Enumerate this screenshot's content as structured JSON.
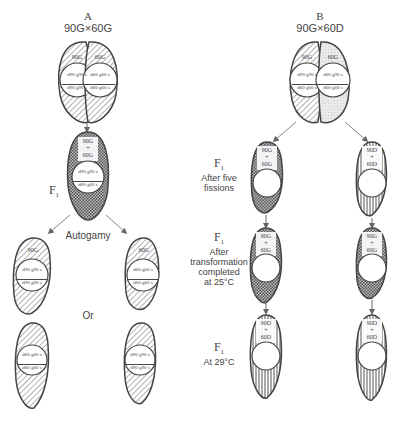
{
  "panels": {
    "a": {
      "letter": "A",
      "cross": "90G×60G",
      "parent_left": {
        "serotype": "90G",
        "genotype_top": "d90 g90 s",
        "genotype_bottom": "d90 g90 s"
      },
      "parent_right": {
        "serotype": "60G",
        "genotype_top": "d60 g60 s",
        "genotype_bottom": "d60 g60 s"
      },
      "f1": {
        "label": "F",
        "sub": "1",
        "serotype_top": "90G",
        "plus": "+",
        "serotype_bottom": "60G",
        "genotype_top": "d90 g90 s",
        "genotype_bottom": "d60 g60 s"
      },
      "process": "Autogamy",
      "or": "Or",
      "exconjugant_left": {
        "serotype": "90G",
        "genotype_top": "d90 g90 s",
        "genotype_bottom": "d90 g90 s"
      },
      "exconjugant_right": {
        "serotype": "60G",
        "genotype_top": "d60 g60 s",
        "genotype_bottom": "d60 g60 s"
      },
      "bottom_left": {
        "genotype_top": "d60 g60 s",
        "genotype_bottom": "d60 g60 s"
      },
      "bottom_right": {
        "genotype_top": "d90 g90 s",
        "genotype_bottom": "d90 g90 s"
      }
    },
    "b": {
      "letter": "B",
      "cross": "90G×60D",
      "parent_left": {
        "serotype": "90G",
        "genotype_top": "d90 g90 s",
        "genotype_bottom": "d60 g60 s"
      },
      "parent_right": {
        "serotype": "60G",
        "genotype_top": "d60 g90 s",
        "genotype_bottom": "d60 g60 s"
      },
      "rows": [
        {
          "label": "F",
          "sub": "1",
          "text": [
            "After five",
            "fissions"
          ],
          "left": {
            "top": "90G",
            "plus": "+",
            "bottom": "60G"
          },
          "right": {
            "top": "90D",
            "plus": "+",
            "bottom": "60D"
          }
        },
        {
          "label": "F",
          "sub": "1",
          "text": [
            "After",
            "transformation",
            "completed",
            "at 25°C"
          ],
          "left": {
            "top": "90G",
            "plus": "+",
            "bottom": "60G"
          },
          "right": {
            "top": "90G",
            "plus": "+",
            "bottom": "60G"
          }
        },
        {
          "label": "F",
          "sub": "1",
          "text": [
            "At 29°C"
          ],
          "left": {
            "top": "90D",
            "plus": "+",
            "bottom": "60D"
          },
          "right": {
            "top": "90D",
            "plus": "+",
            "bottom": "60D"
          }
        }
      ]
    }
  },
  "colors": {
    "ink": "#444444",
    "fill_light": "#e6e6e6",
    "background": "#ffffff"
  }
}
